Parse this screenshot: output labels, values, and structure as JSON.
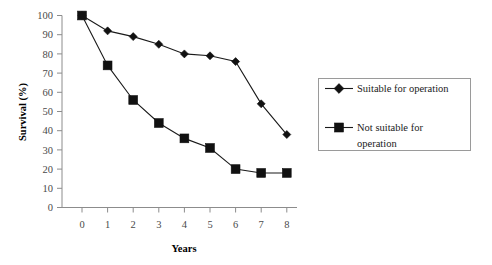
{
  "chart_data": {
    "type": "line",
    "title": "",
    "subtitle": "",
    "xlabel": "Years",
    "ylabel": "Survival (%)",
    "x": [
      0,
      1,
      2,
      3,
      4,
      5,
      6,
      7,
      8
    ],
    "xticklabels": [
      "0",
      "1",
      "2",
      "3",
      "4",
      "5",
      "6",
      "7",
      "8"
    ],
    "yticklabels": [
      "0",
      "10",
      "20",
      "30",
      "40",
      "50",
      "60",
      "70",
      "80",
      "90",
      "100"
    ],
    "xlim": [
      0,
      8
    ],
    "ylim": [
      0,
      100
    ],
    "grid": false,
    "legend_position": "right",
    "series": [
      {
        "name": "Suitable for operation",
        "marker": "diamond",
        "color": "#111111",
        "values": [
          100,
          92,
          89,
          85,
          80,
          79,
          76,
          54,
          38
        ]
      },
      {
        "name": "Not suitable for operation",
        "marker": "square",
        "color": "#111111",
        "values": [
          100,
          74,
          56,
          44,
          36,
          31,
          20,
          18,
          18
        ]
      }
    ]
  },
  "legend": {
    "entries": [
      {
        "label": "Suitable for operation",
        "marker": "diamond-marker-icon"
      },
      {
        "label": "Not suitable for operation",
        "label_line1": "Not suitable for",
        "label_line2": "operation",
        "marker": "square-marker-icon"
      }
    ]
  },
  "axes": {
    "y_title": "Survival (%)",
    "x_title": "Years"
  }
}
